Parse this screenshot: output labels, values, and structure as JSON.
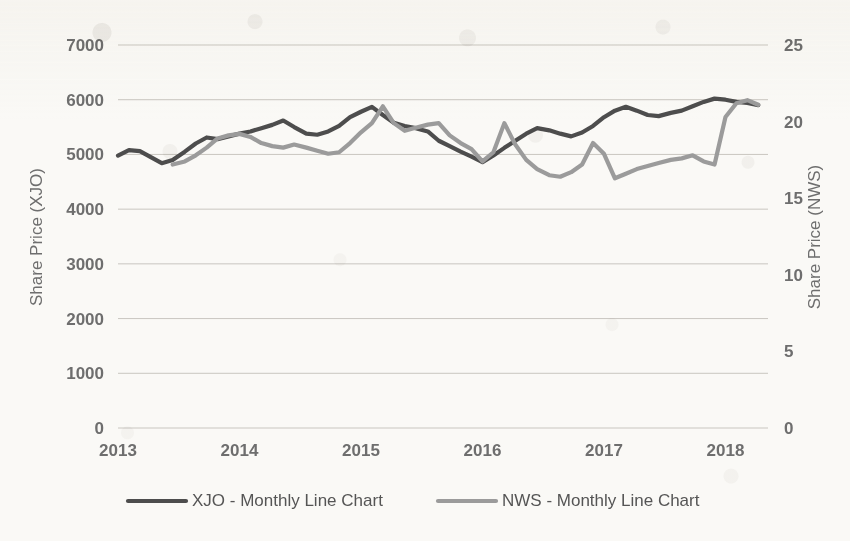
{
  "chart_data": {
    "type": "line",
    "title": "",
    "xlabel": "",
    "ylabel": "Share Price (XJO)",
    "y2label": "Share Price (NWS)",
    "xlim": [
      2013.0,
      2018.35
    ],
    "ylim": [
      0,
      7000
    ],
    "y2lim": [
      0,
      25
    ],
    "yticks": [
      0,
      1000,
      2000,
      3000,
      4000,
      5000,
      6000,
      7000
    ],
    "ytick_labels": [
      "0",
      "1000",
      "2000",
      "3000",
      "4000",
      "5000",
      "6000",
      "7000"
    ],
    "y2ticks": [
      0,
      5,
      10,
      15,
      20,
      25
    ],
    "y2tick_labels": [
      "0",
      "5",
      "10",
      "15",
      "20",
      "25"
    ],
    "xticks": [
      2013,
      2014,
      2015,
      2016,
      2017,
      2018
    ],
    "xtick_labels": [
      "2013",
      "2014",
      "2015",
      "2016",
      "2017",
      "2018"
    ],
    "grid": true,
    "legend_position": "bottom",
    "series": [
      {
        "name": "XJO - Monthly Line Chart",
        "color": "#4d4d4d",
        "axis": "left",
        "x": [
          2013.0,
          2013.09,
          2013.18,
          2013.27,
          2013.36,
          2013.45,
          2013.55,
          2013.64,
          2013.73,
          2013.82,
          2013.91,
          2014.0,
          2014.09,
          2014.18,
          2014.27,
          2014.36,
          2014.45,
          2014.55,
          2014.64,
          2014.73,
          2014.82,
          2014.91,
          2015.0,
          2015.09,
          2015.18,
          2015.27,
          2015.36,
          2015.45,
          2015.55,
          2015.64,
          2015.73,
          2015.82,
          2015.91,
          2016.0,
          2016.09,
          2016.18,
          2016.27,
          2016.36,
          2016.45,
          2016.55,
          2016.64,
          2016.73,
          2016.82,
          2016.91,
          2017.0,
          2017.09,
          2017.18,
          2017.27,
          2017.36,
          2017.45,
          2017.55,
          2017.64,
          2017.73,
          2017.82,
          2017.91,
          2018.0,
          2018.09,
          2018.18,
          2018.27
        ],
        "y": [
          4980,
          5080,
          5060,
          4950,
          4840,
          4900,
          5050,
          5200,
          5310,
          5280,
          5330,
          5380,
          5420,
          5480,
          5540,
          5620,
          5500,
          5380,
          5360,
          5420,
          5520,
          5680,
          5780,
          5870,
          5720,
          5580,
          5520,
          5480,
          5420,
          5250,
          5150,
          5050,
          4960,
          4860,
          4980,
          5120,
          5250,
          5380,
          5480,
          5440,
          5380,
          5330,
          5400,
          5520,
          5680,
          5800,
          5870,
          5800,
          5720,
          5700,
          5760,
          5800,
          5880,
          5960,
          6020,
          6000,
          5960,
          5940,
          5900
        ]
      },
      {
        "name": "NWS - Monthly Line Chart",
        "color": "#9b9b9b",
        "axis": "right",
        "x": [
          2013.45,
          2013.55,
          2013.64,
          2013.73,
          2013.82,
          2013.91,
          2014.0,
          2014.09,
          2014.18,
          2014.27,
          2014.36,
          2014.45,
          2014.55,
          2014.64,
          2014.73,
          2014.82,
          2014.91,
          2015.0,
          2015.09,
          2015.18,
          2015.27,
          2015.36,
          2015.45,
          2015.55,
          2015.64,
          2015.73,
          2015.82,
          2015.91,
          2016.0,
          2016.09,
          2016.18,
          2016.27,
          2016.36,
          2016.45,
          2016.55,
          2016.64,
          2016.73,
          2016.82,
          2016.91,
          2017.0,
          2017.09,
          2017.18,
          2017.27,
          2017.36,
          2017.45,
          2017.55,
          2017.64,
          2017.73,
          2017.82,
          2017.91,
          2018.0,
          2018.09,
          2018.18,
          2018.27
        ],
        "y": [
          17.2,
          17.4,
          17.8,
          18.3,
          18.9,
          19.1,
          19.2,
          19.0,
          18.6,
          18.4,
          18.3,
          18.5,
          18.3,
          18.1,
          17.9,
          18.0,
          18.6,
          19.3,
          19.9,
          21.0,
          19.9,
          19.4,
          19.6,
          19.8,
          19.9,
          19.1,
          18.6,
          18.2,
          17.4,
          18.0,
          19.9,
          18.5,
          17.5,
          16.9,
          16.5,
          16.4,
          16.7,
          17.2,
          18.6,
          17.9,
          16.3,
          16.6,
          16.9,
          17.1,
          17.3,
          17.5,
          17.6,
          17.8,
          17.4,
          17.2,
          20.3,
          21.2,
          21.4,
          21.1
        ]
      }
    ]
  },
  "legend": {
    "items": [
      {
        "label": "XJO - Monthly Line Chart",
        "color": "#4d4d4d"
      },
      {
        "label": "NWS - Monthly Line Chart",
        "color": "#9b9b9b"
      }
    ]
  }
}
